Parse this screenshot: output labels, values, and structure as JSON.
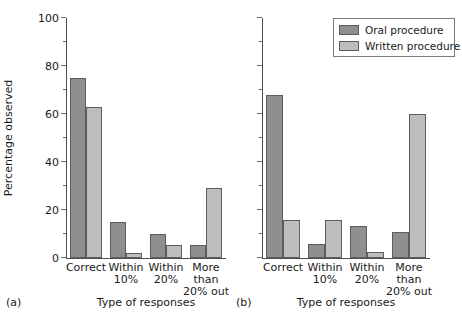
{
  "chart_data": [
    {
      "type": "bar",
      "panel": "(a)",
      "title": "",
      "xlabel": "Type of responses",
      "ylabel": "Percentage observed",
      "categories": [
        "Correct",
        "Within 10%",
        "Within 20%",
        "More than 20% out"
      ],
      "category_lines": [
        [
          "Correct"
        ],
        [
          "Within",
          "10%"
        ],
        [
          "Within",
          "20%"
        ],
        [
          "More than",
          "20% out"
        ]
      ],
      "series": [
        {
          "name": "Oral procedure",
          "values": [
            75,
            15,
            10,
            5.5
          ],
          "color": "#8f8f8f"
        },
        {
          "name": "Written procedure",
          "values": [
            63,
            2,
            5.5,
            29
          ],
          "color": "#bdbdbd"
        }
      ],
      "ylim": [
        0,
        100
      ],
      "yticks": [
        0,
        20,
        40,
        60,
        80,
        100
      ],
      "ytick_labels": [
        "0",
        "20",
        "40",
        "60",
        "80",
        "100"
      ],
      "yminor_step": 10,
      "grid": false,
      "legend": false
    },
    {
      "type": "bar",
      "panel": "(b)",
      "title": "",
      "xlabel": "Type of responses",
      "ylabel": "",
      "categories": [
        "Correct",
        "Within 10%",
        "Within 20%",
        "More than 20% out"
      ],
      "category_lines": [
        [
          "Correct"
        ],
        [
          "Within",
          "10%"
        ],
        [
          "Within",
          "20%"
        ],
        [
          "More than",
          "20% out"
        ]
      ],
      "series": [
        {
          "name": "Oral procedure",
          "values": [
            68,
            6,
            13.5,
            11
          ],
          "color": "#8f8f8f"
        },
        {
          "name": "Written procedure",
          "values": [
            16,
            16,
            2.5,
            60
          ],
          "color": "#bdbdbd"
        }
      ],
      "ylim": [
        0,
        100
      ],
      "yticks": [
        0,
        20,
        40,
        60,
        80,
        100
      ],
      "ytick_labels": [
        "",
        "",
        "",
        "",
        "",
        ""
      ],
      "yminor_step": 10,
      "grid": false,
      "legend": true,
      "legend_position": "top-right"
    }
  ],
  "legend": {
    "entries": [
      {
        "label": "Oral procedure",
        "color": "#8f8f8f"
      },
      {
        "label": "Written procedure",
        "color": "#bdbdbd"
      }
    ]
  },
  "panel_a": {
    "tag": "(a)",
    "ylabel": "Percentage observed",
    "xlabel": "Type of responses",
    "ytick_labels": [
      "100",
      "80",
      "60",
      "40",
      "20",
      "0"
    ],
    "xticks": [
      {
        "line1": "Correct",
        "line2": ""
      },
      {
        "line1": "Within",
        "line2": "10%"
      },
      {
        "line1": "Within",
        "line2": "20%"
      },
      {
        "line1": "More than",
        "line2": "20% out"
      }
    ]
  },
  "panel_b": {
    "tag": "(b)",
    "ylabel": "",
    "xlabel": "Type of responses",
    "xticks": [
      {
        "line1": "Correct",
        "line2": ""
      },
      {
        "line1": "Within",
        "line2": "10%"
      },
      {
        "line1": "Within",
        "line2": "20%"
      },
      {
        "line1": "More than",
        "line2": "20% out"
      }
    ]
  }
}
